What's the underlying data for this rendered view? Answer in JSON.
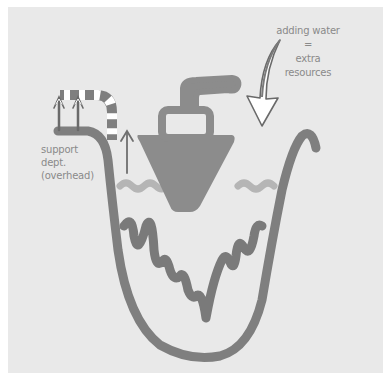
{
  "diagram": {
    "colors": {
      "background": "#e9e9e9",
      "page": "#ffffff",
      "stroke": "#7f7f7f",
      "boat": "#8c8c8c",
      "waves": "#b3b3b3",
      "text": "#8a8a8a"
    },
    "labels": {
      "adding_water": {
        "line1": "adding water",
        "line2": "=",
        "line3": "extra",
        "line4": "resources"
      },
      "support_dept": {
        "line1": "support",
        "line2": "dept.",
        "line3": "(overhead)"
      }
    },
    "elements": [
      {
        "name": "valley-outline",
        "icon": "u-shaped-valley"
      },
      {
        "name": "rocks-bottom",
        "icon": "zigzag-rocks"
      },
      {
        "name": "boat",
        "icon": "steamboat"
      },
      {
        "name": "water-surface",
        "icon": "wavy-line"
      },
      {
        "name": "adding-water-arrow",
        "icon": "down-arrow"
      },
      {
        "name": "overflow-pipe",
        "icon": "striped-pipe"
      },
      {
        "name": "rising-arrows",
        "icon": "up-arrows"
      }
    ]
  }
}
